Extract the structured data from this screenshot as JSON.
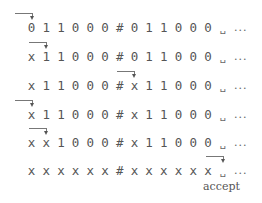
{
  "diagram": {
    "rows": [
      {
        "cells": [
          "0",
          "1",
          "1",
          "0",
          "0",
          "0",
          "#",
          "0",
          "1",
          "1",
          "0",
          "0",
          "0",
          "␣"
        ],
        "ellipsis": "...",
        "head_index": 0
      },
      {
        "cells": [
          "x",
          "1",
          "1",
          "0",
          "0",
          "0",
          "#",
          "0",
          "1",
          "1",
          "0",
          "0",
          "0",
          "␣"
        ],
        "ellipsis": "...",
        "head_index": 1
      },
      {
        "cells": [
          "x",
          "1",
          "1",
          "0",
          "0",
          "0",
          "#",
          "x",
          "1",
          "1",
          "0",
          "0",
          "0",
          "␣"
        ],
        "ellipsis": "...",
        "head_index": 7
      },
      {
        "cells": [
          "x",
          "1",
          "1",
          "0",
          "0",
          "0",
          "#",
          "x",
          "1",
          "1",
          "0",
          "0",
          "0",
          "␣"
        ],
        "ellipsis": "...",
        "head_index": 0
      },
      {
        "cells": [
          "x",
          "x",
          "1",
          "0",
          "0",
          "0",
          "#",
          "x",
          "1",
          "1",
          "0",
          "0",
          "0",
          "␣"
        ],
        "ellipsis": "...",
        "head_index": 1
      },
      {
        "cells": [
          "x",
          "x",
          "x",
          "x",
          "x",
          "x",
          "#",
          "x",
          "x",
          "x",
          "x",
          "x",
          "x",
          "␣"
        ],
        "ellipsis": "...",
        "head_index": 13
      }
    ],
    "final_state_label": "accept",
    "icons": {
      "head": "head-arrow-icon",
      "blank": "blank-symbol"
    },
    "colors": {
      "text": "#555555",
      "arrow": "#777777"
    }
  }
}
